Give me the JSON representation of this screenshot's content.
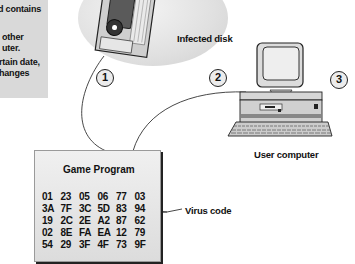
{
  "sidebar_text": {
    "lines": [
      "d contains",
      "",
      "other",
      "uter.",
      "rtain date,",
      "hanges"
    ]
  },
  "labels": {
    "infected_disk": "Infected disk",
    "user_computer": "User computer",
    "virus_code": "Virus code"
  },
  "steps": [
    "1",
    "2",
    "3"
  ],
  "program": {
    "title": "Game Program",
    "rows": [
      [
        "01",
        "23",
        "05",
        "06",
        "77",
        "03"
      ],
      [
        "3A",
        "7F",
        "3C",
        "5D",
        "83",
        "94"
      ],
      [
        "19",
        "2C",
        "2E",
        "A2",
        "87",
        "62"
      ],
      [
        "02",
        "8E",
        "FA",
        "EA",
        "12",
        "79"
      ],
      [
        "54",
        "29",
        "3F",
        "4F",
        "73",
        "9F"
      ]
    ]
  },
  "colors": {
    "sidebar_bg": "#d9d9d9",
    "ink": "#111111",
    "box_bg": "#e6e6e6"
  }
}
